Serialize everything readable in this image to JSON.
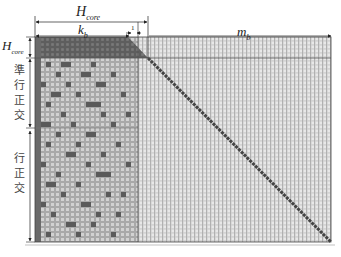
{
  "diagram": {
    "top_labels": {
      "h_core": "H",
      "h_core_sub": "core",
      "k_b": "k",
      "k_b_sub": "b",
      "m_b": "m",
      "m_b_sub": "b",
      "one": "1"
    },
    "left_labels": {
      "h_core": "H",
      "h_core_sub": "core",
      "quasi_row_orthogonal": "準行正交",
      "row_orthogonal": "行正交"
    },
    "colors": {
      "dark_cell": "#555555",
      "mid_cell": "#9a9a9a",
      "light_cell": "#d8d8d8",
      "grid_bg": "#c4c4c4",
      "diagonal": "#4a4a4a",
      "arrow": "#222222"
    },
    "regions": [
      {
        "name": "H_core",
        "rows": "top",
        "cols": "k_b + 1"
      },
      {
        "name": "quasi-row-orthogonal",
        "rows": "middle"
      },
      {
        "name": "row-orthogonal",
        "rows": "bottom"
      },
      {
        "name": "identity-diagonal",
        "cols": "m_b"
      }
    ]
  }
}
